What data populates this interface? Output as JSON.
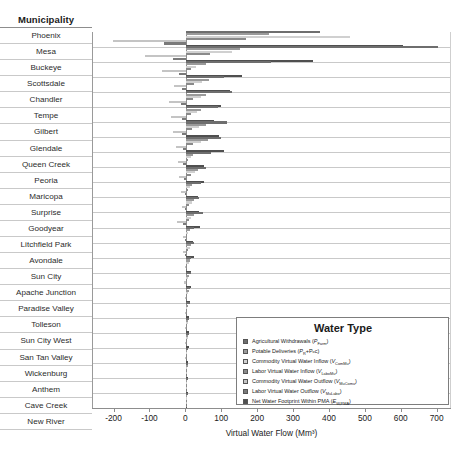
{
  "header": {
    "municipality_label": "Municipality"
  },
  "axis": {
    "xlabel": "Virtual Water Flow (Mm³)",
    "ticks": [
      -200,
      -100,
      0,
      100,
      200,
      300,
      400,
      500,
      600,
      700
    ],
    "xlim": [
      -260,
      740
    ]
  },
  "legend": {
    "title": "Water Type",
    "items": [
      {
        "label": "Agricultural Withdrawals (",
        "sym": "P",
        "sub": "Farm",
        "tail": ")",
        "color": "#6e6e6e"
      },
      {
        "label": "Potable Deliveries (",
        "sym": "P",
        "sub": "R",
        "tail": "+Pₒᴄ)",
        "color": "#9a9a9a"
      },
      {
        "label": "Commodity Virtual Water Inflow (",
        "sym": "V",
        "sub": "ComMu",
        "tail": ")",
        "color": "#d0d0d0"
      },
      {
        "label": "Labor Virtual Water Inflow (",
        "sym": "V",
        "sub": "LaboMu",
        "tail": ")",
        "color": "#8a8a8a"
      },
      {
        "label": "Commodity Virtual Water Outflow (",
        "sym": "V",
        "sub": "MuComu",
        "tail": ")",
        "color": "#c4c4c4"
      },
      {
        "label": "Labor Virtual Water Outflow (",
        "sym": "V",
        "sub": "MuLabo",
        "tail": ")",
        "color": "#7a7a7a"
      },
      {
        "label": "Net Water Footprint Within PMA (",
        "sym": "E",
        "sub": "W,PMA",
        "tail": ")",
        "color": "#4f4f4f"
      }
    ]
  },
  "chart_data": {
    "type": "bar",
    "orientation": "horizontal",
    "title": "",
    "xlabel": "Virtual Water Flow (Mm³)",
    "ylabel": "Municipality",
    "xlim": [
      -260,
      740
    ],
    "grid": true,
    "legend_position": "lower-right",
    "categories": [
      "Phoenix",
      "Mesa",
      "Buckeye",
      "Scottsdale",
      "Chandler",
      "Tempe",
      "Gilbert",
      "Glendale",
      "Queen Creek",
      "Peoria",
      "Maricopa",
      "Surprise",
      "Goodyear",
      "Litchfield Park",
      "Avondale",
      "Sun City",
      "Apache Junction",
      "Paradise Valley",
      "Tolleson",
      "Sun City West",
      "San Tan Valley",
      "Wickenburg",
      "Anthem",
      "Cave Creek",
      "New River"
    ],
    "series": [
      {
        "name": "Agricultural Withdrawals (P_Farm)",
        "color": "#6e6e6e",
        "values": [
          372,
          700,
          236,
          106,
          126,
          88,
          112,
          96,
          70,
          54,
          40,
          34,
          46,
          22,
          20,
          12,
          14,
          10,
          9,
          8,
          7,
          6,
          5,
          5,
          4
        ]
      },
      {
        "name": "Potable Deliveries (P_R+P_OC)",
        "color": "#9a9a9a",
        "values": [
          230,
          150,
          55,
          62,
          56,
          42,
          54,
          60,
          18,
          32,
          16,
          22,
          20,
          9,
          13,
          9,
          8,
          8,
          5,
          6,
          5,
          3,
          4,
          3,
          2
        ]
      },
      {
        "name": "Commodity Virtual Water Inflow (V_ComMu)",
        "color": "#d0d0d0",
        "values": [
          455,
          128,
          28,
          44,
          40,
          30,
          34,
          40,
          12,
          24,
          10,
          16,
          14,
          6,
          10,
          7,
          6,
          6,
          3,
          4,
          4,
          2,
          3,
          2,
          2
        ]
      },
      {
        "name": "Labor Virtual Water Inflow (V_LaboMu)",
        "color": "#8a8a8a",
        "values": [
          166,
          66,
          14,
          22,
          18,
          14,
          16,
          18,
          6,
          12,
          5,
          8,
          7,
          3,
          5,
          3,
          3,
          3,
          2,
          2,
          2,
          1,
          1,
          1,
          1
        ]
      },
      {
        "name": "Commodity Virtual Water Outflow (V_MuComu)",
        "color": "#c4c4c4",
        "values": [
          -205,
          -115,
          -68,
          -33,
          -48,
          -44,
          -38,
          -30,
          -24,
          -20,
          -16,
          -12,
          -26,
          -8,
          -9,
          -5,
          -6,
          -5,
          -4,
          -4,
          -3,
          -3,
          -2,
          -2,
          -2
        ]
      },
      {
        "name": "Labor Virtual Water Outflow (V_MuLabo)",
        "color": "#7a7a7a",
        "values": [
          -62,
          -36,
          -20,
          -11,
          -15,
          -13,
          -12,
          -9,
          -8,
          -7,
          -5,
          -4,
          -8,
          -3,
          -3,
          -2,
          -2,
          -2,
          -1,
          -1,
          -1,
          -1,
          -1,
          -1,
          -1
        ]
      },
      {
        "name": "Net Water Footprint Within PMA (E_W,PMA)",
        "color": "#4f4f4f",
        "values": [
          604,
          352,
          156,
          122,
          96,
          76,
          92,
          104,
          48,
          50,
          32,
          36,
          38,
          18,
          20,
          12,
          13,
          11,
          8,
          8,
          7,
          5,
          5,
          4,
          3
        ]
      }
    ]
  }
}
